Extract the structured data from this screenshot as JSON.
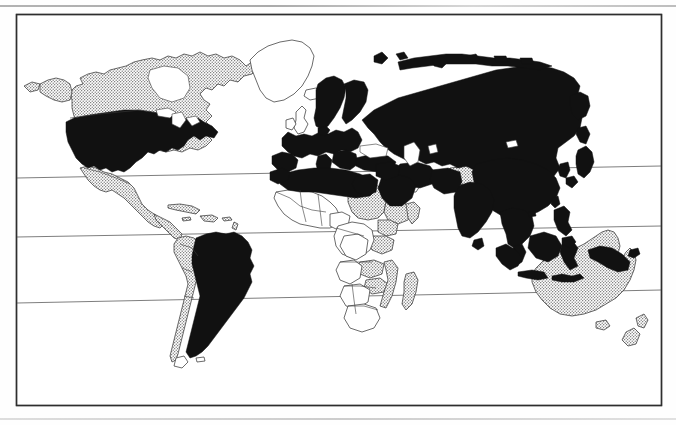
{
  "figure": {
    "kind": "world-map",
    "title": "World map with countries shaded in three categories",
    "frame": {
      "x": 16,
      "y": 14,
      "width": 646,
      "height": 392
    },
    "projection": "cylindrical-equirectangular",
    "scan_skew_degrees": -1.1,
    "background_color": "#fefefe",
    "line_color": "#3a3a3a",
    "frame_color": "#2e2e2e"
  },
  "legend_categories": [
    {
      "key": "solid",
      "label": "Solid black fill",
      "color": "#111111",
      "pattern": "solid"
    },
    {
      "key": "stippled",
      "label": "Stippled / dotted fill",
      "color": "#8a8a8a",
      "pattern": "dots"
    },
    {
      "key": "blank",
      "label": "Unshaded white fill",
      "color": "#ffffff",
      "pattern": "none"
    }
  ],
  "graticule": {
    "visible_lines": 3,
    "labels": [
      "Tropic of Cancer",
      "Equator",
      "Tropic of Capricorn"
    ],
    "lines": [
      {
        "name": "Tropic of Cancer",
        "y_left": 178,
        "y_right": 166
      },
      {
        "name": "Equator",
        "y_left": 237,
        "y_right": 226
      },
      {
        "name": "Tropic of Capricorn",
        "y_left": 303,
        "y_right": 290
      }
    ]
  },
  "regions": {
    "solid": [
      "United States",
      "Brazil",
      "Western Europe",
      "Scandinavia",
      "Russia",
      "China",
      "India",
      "Southeast Asia mainland",
      "Indonesia",
      "Philippines",
      "Japan",
      "Korea",
      "Turkey",
      "Iran",
      "Saudi Arabia",
      "Algeria",
      "Libya",
      "Egypt",
      "Papua New Guinea"
    ],
    "stippled": [
      "Canada",
      "Alaska",
      "Mexico",
      "Central America",
      "Caribbean",
      "Colombia",
      "Peru",
      "Bolivia",
      "Chile",
      "Greenland edge",
      "Sudan",
      "Ethiopia",
      "Kenya",
      "Tanzania",
      "Zambia",
      "Zimbabwe",
      "Mozambique",
      "Madagascar",
      "Kazakhstan",
      "Australia",
      "New Zealand"
    ],
    "blank": [
      "Greenland",
      "Iceland",
      "United Kingdom",
      "Ireland",
      "West Africa",
      "Central Africa",
      "Southern Africa",
      "Mongolia",
      "Namibia",
      "Angola",
      "South Africa",
      "Argentina south"
    ]
  }
}
